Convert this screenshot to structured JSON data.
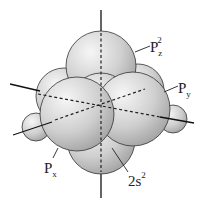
{
  "diagram": {
    "title": "",
    "labels": {
      "pz": {
        "main": "P",
        "sub": "z",
        "sup": "2"
      },
      "py": {
        "main": "P",
        "sub": "y"
      },
      "px": {
        "main": "P",
        "sub": "x"
      },
      "s": {
        "main": "2s",
        "sup": "2"
      }
    },
    "colors": {
      "sphere_light": "#f4f4f4",
      "sphere_dark": "#a8a8a8",
      "outline": "#333333",
      "axis": "#111111"
    }
  }
}
